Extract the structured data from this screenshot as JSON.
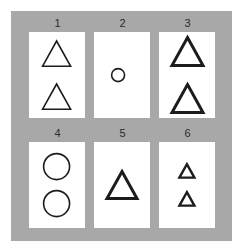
{
  "panel": {
    "background_color": "#a8a8a8",
    "card_color": "#ffffff",
    "ink_color": "#1c1c1c"
  },
  "cards": [
    {
      "number": "1",
      "shape_type": "triangle",
      "shape_count": 2,
      "shape_size": 28,
      "stroke_width": 1.6,
      "gap": 10,
      "offset_x": 0
    },
    {
      "number": "2",
      "shape_type": "circle",
      "shape_count": 1,
      "shape_size": 13,
      "stroke_width": 1.6,
      "gap": 0,
      "offset_x": -4
    },
    {
      "number": "3",
      "shape_type": "triangle",
      "shape_count": 2,
      "shape_size": 31,
      "stroke_width": 3.0,
      "gap": 8,
      "offset_x": 0
    },
    {
      "number": "4",
      "shape_type": "circle",
      "shape_count": 2,
      "shape_size": 26,
      "stroke_width": 1.6,
      "gap": 6,
      "offset_x": 0
    },
    {
      "number": "5",
      "shape_type": "triangle",
      "shape_count": 1,
      "shape_size": 30,
      "stroke_width": 3.0,
      "gap": 0,
      "offset_x": 0
    },
    {
      "number": "6",
      "shape_type": "triangle",
      "shape_count": 2,
      "shape_size": 15,
      "stroke_width": 2.4,
      "gap": 6,
      "offset_x": 0
    }
  ]
}
